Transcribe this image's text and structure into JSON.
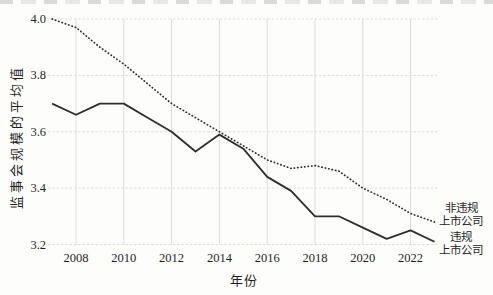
{
  "chart_data": {
    "type": "line",
    "title": "",
    "xlabel": "年份",
    "ylabel": "监事会规模的平均值",
    "x": [
      2007,
      2008,
      2009,
      2010,
      2011,
      2012,
      2013,
      2014,
      2015,
      2016,
      2017,
      2018,
      2019,
      2020,
      2021,
      2022,
      2023
    ],
    "series": [
      {
        "name": "非违规上市公司",
        "line_style": "dotted",
        "values": [
          4.0,
          3.97,
          3.9,
          3.84,
          3.77,
          3.7,
          3.65,
          3.6,
          3.55,
          3.5,
          3.47,
          3.48,
          3.46,
          3.4,
          3.36,
          3.31,
          3.28
        ]
      },
      {
        "name": "违规上市公司",
        "line_style": "solid",
        "values": [
          3.7,
          3.66,
          3.7,
          3.7,
          3.65,
          3.6,
          3.53,
          3.59,
          3.54,
          3.44,
          3.39,
          3.3,
          3.3,
          3.26,
          3.22,
          3.25,
          3.21
        ]
      }
    ],
    "ylim": [
      3.2,
      4.0
    ],
    "xlim": [
      2007,
      2023
    ],
    "y_ticks": [
      4.0,
      3.8,
      3.6,
      3.4,
      3.2
    ],
    "x_ticks": [
      2008,
      2010,
      2012,
      2014,
      2016,
      2018,
      2020,
      2022
    ],
    "grid": true,
    "legend_position": "right-of-line-ends"
  },
  "legend": [
    {
      "line1": "非违规",
      "line2": "上市公司"
    },
    {
      "line1": "违规",
      "line2": "上市公司"
    }
  ],
  "colors": {
    "line": "#2e2e2e",
    "grid": "#d9d9d9",
    "text": "#1f1f1f",
    "background": "#fdfdfc"
  }
}
